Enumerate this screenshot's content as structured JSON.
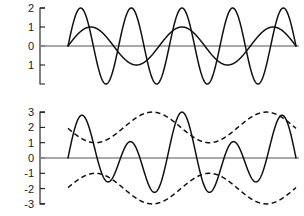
{
  "figure": {
    "title": "",
    "background_color": "#ffffff",
    "curve_color": "#101010",
    "axis_color": "#8c8c8c"
  },
  "chart_data": [
    {
      "type": "line",
      "id": "component-waves",
      "title": "",
      "xlabel": "",
      "ylabel": "",
      "xlim": [
        0,
        9
      ],
      "ylim": [
        -2,
        2
      ],
      "yticks": [
        2,
        1,
        0,
        -1
      ],
      "ytick_labels": [
        "2",
        "1",
        "0",
        "1"
      ],
      "xticks": [],
      "xtick_labels": [],
      "grid": false,
      "legend": false,
      "legend_position": "none",
      "series": [
        {
          "name": "large-amplitude wave",
          "style": "solid",
          "amplitude": 2,
          "cycles": 4.5,
          "phase": 0
        },
        {
          "name": "small-amplitude wave",
          "style": "solid",
          "amplitude": 1,
          "cycles": 2.5,
          "phase": 0
        }
      ]
    },
    {
      "type": "line",
      "id": "sum-wave-with-envelope",
      "title": "",
      "xlabel": "",
      "ylabel": "",
      "xlim": [
        0,
        9
      ],
      "ylim": [
        -3,
        3
      ],
      "yticks": [
        3,
        2,
        1,
        0,
        -1,
        -2,
        -3
      ],
      "ytick_labels": [
        "3",
        "2",
        "1",
        "0",
        "-1",
        "-2",
        "-3"
      ],
      "xticks": [],
      "xtick_labels": [],
      "grid": false,
      "legend": false,
      "legend_position": "none",
      "series": [
        {
          "name": "sum of waves",
          "style": "solid",
          "amplitude": 3,
          "cycles": 4.5,
          "phase": 0
        },
        {
          "name": "upper envelope",
          "style": "dashed",
          "amplitude": 3,
          "cycles": 2.5,
          "phase": 0
        },
        {
          "name": "lower envelope",
          "style": "dashed",
          "amplitude": 3,
          "cycles": 2.5,
          "phase": 0
        }
      ]
    }
  ],
  "top_panel": {
    "name": "component-waves-panel",
    "ytick_labels": [
      "2",
      "1",
      "0",
      "1"
    ]
  },
  "bottom_panel": {
    "name": "sum-wave-panel",
    "ytick_labels": [
      "3",
      "2",
      "1",
      "0",
      "-1",
      "-2",
      "-3"
    ]
  }
}
